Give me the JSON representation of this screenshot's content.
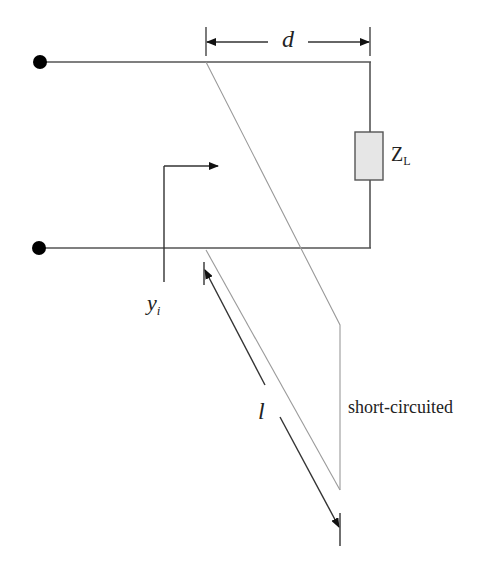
{
  "diagram": {
    "type": "transmission-line single-stub matching circuit",
    "labels": {
      "distance": "d",
      "load_main": "Z",
      "load_sub": "L",
      "input_admittance_main": "y",
      "input_admittance_sub": "i",
      "stub_length": "l",
      "stub_termination": "short-circuited"
    },
    "components": [
      {
        "id": "input-terminal-top",
        "kind": "terminal"
      },
      {
        "id": "input-terminal-bottom",
        "kind": "terminal"
      },
      {
        "id": "load-impedance",
        "kind": "resistor-box",
        "label": "Z_L"
      },
      {
        "id": "stub",
        "kind": "short-circuited stub",
        "length": "l"
      }
    ],
    "colors": {
      "line": "#444444",
      "stub_line": "#9a9a9a",
      "load_fill": "#e6e6e6",
      "terminal": "#000000"
    }
  }
}
